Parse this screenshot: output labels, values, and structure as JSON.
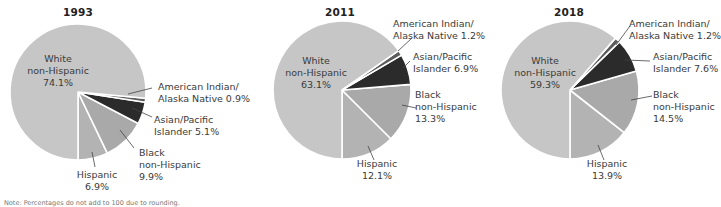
{
  "note": "Note: Percentages do not add to 100 due to rounding.",
  "colors": {
    "white_non_hispanic": "#c6c6c6",
    "american_indian": "#5c5c5c",
    "asian_pacific": "#2b2b2b",
    "black_non_hispanic": "#a9a9a9",
    "hispanic": "#b3b3b3",
    "separator": "#ffffff",
    "leader": "#444444"
  },
  "chart_data": [
    {
      "type": "pie",
      "title": "1993",
      "categories": [
        "White non-Hispanic",
        "American Indian/Alaska Native",
        "Asian/Pacific Islander",
        "Black non-Hispanic",
        "Hispanic"
      ],
      "values": [
        74.1,
        0.9,
        5.1,
        9.9,
        6.9
      ],
      "labels": {
        "white": [
          "White",
          "non-Hispanic",
          "74.1%"
        ],
        "amind": [
          "American Indian/",
          "Alaska Native 0.9%"
        ],
        "asian": [
          "Asian/Pacific",
          "Islander 5.1%"
        ],
        "black": [
          "Black",
          "non-Hispanic",
          "9.9%"
        ],
        "hispanic": [
          "Hispanic",
          "6.9%"
        ]
      }
    },
    {
      "type": "pie",
      "title": "2011",
      "categories": [
        "White non-Hispanic",
        "American Indian/Alaska Native",
        "Asian/Pacific Islander",
        "Black non-Hispanic",
        "Hispanic"
      ],
      "values": [
        63.1,
        1.2,
        6.9,
        13.3,
        12.1
      ],
      "labels": {
        "white": [
          "White",
          "non-Hispanic",
          "63.1%"
        ],
        "amind": [
          "American Indian/",
          "Alaska Native 1.2%"
        ],
        "asian": [
          "Asian/Pacific",
          "Islander 6.9%"
        ],
        "black": [
          "Black",
          "non-Hispanic",
          "13.3%"
        ],
        "hispanic": [
          "Hispanic",
          "12.1%"
        ]
      }
    },
    {
      "type": "pie",
      "title": "2018",
      "categories": [
        "White non-Hispanic",
        "American Indian/Alaska Native",
        "Asian/Pacific Islander",
        "Black non-Hispanic",
        "Hispanic"
      ],
      "values": [
        59.3,
        1.2,
        7.6,
        14.5,
        13.9
      ],
      "labels": {
        "white": [
          "White",
          "non-Hispanic",
          "59.3%"
        ],
        "amind": [
          "American Indian/",
          "Alaska Native 1.2%"
        ],
        "asian": [
          "Asian/Pacific",
          "Islander 7.6%"
        ],
        "black": [
          "Black",
          "non-Hispanic",
          "14.5%"
        ],
        "hispanic": [
          "Hispanic",
          "13.9%"
        ]
      }
    }
  ]
}
